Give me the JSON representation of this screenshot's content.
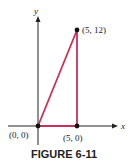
{
  "figure": {
    "caption": "FIGURE 6-11",
    "axes": {
      "x_label": "x",
      "y_label": "y"
    },
    "points": [
      {
        "label": "(0, 0)",
        "x": 0,
        "y": 0
      },
      {
        "label": "(5, 0)",
        "x": 5,
        "y": 0
      },
      {
        "label": "(5, 12)",
        "x": 5,
        "y": 12
      }
    ],
    "colors": {
      "triangle": "#c8325a",
      "axes": "#222222",
      "points": "#111111"
    }
  }
}
